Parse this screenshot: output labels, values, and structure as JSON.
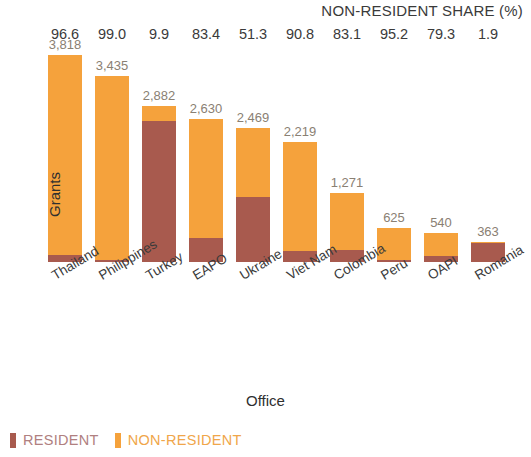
{
  "header": {
    "share_title": "NON-RESIDENT SHARE (%)"
  },
  "axes": {
    "y_title": "Grants",
    "x_title": "Office"
  },
  "legend": {
    "resident_label": "RESIDENT",
    "non_resident_label": "NON-RESIDENT",
    "resident_color": "#A85A4E",
    "non_resident_color": "#F5A23C"
  },
  "chart_data": {
    "type": "bar",
    "title": "",
    "subtitle": "",
    "xlabel": "Office",
    "ylabel": "Grants",
    "stacked": true,
    "grid": false,
    "legend_position": "bottom-left",
    "ylim": [
      0,
      4000
    ],
    "categories": [
      "Thailand",
      "Philippines",
      "Turkey",
      "EAPO",
      "Ukraine",
      "Viet Nam",
      "Colombia",
      "Peru",
      "OAPI",
      "Romania"
    ],
    "totals": [
      3818,
      3435,
      2882,
      2630,
      2469,
      2219,
      1271,
      625,
      540,
      363
    ],
    "total_labels": [
      "3,818",
      "3,435",
      "2,882",
      "2,630",
      "2,469",
      "2,219",
      "1,271",
      "625",
      "540",
      "363"
    ],
    "non_resident_share_pct": [
      96.6,
      99.0,
      9.9,
      83.4,
      51.3,
      90.8,
      83.1,
      95.2,
      79.3,
      1.9
    ],
    "non_resident_share_labels": [
      "96.6",
      "99.0",
      "9.9",
      "83.4",
      "51.3",
      "90.8",
      "83.1",
      "95.2",
      "79.3",
      "1.9"
    ],
    "series": [
      {
        "name": "RESIDENT",
        "color": "#A85A4E",
        "values": [
          130,
          34,
          2597,
          437,
          1202,
          204,
          215,
          30,
          112,
          356
        ]
      },
      {
        "name": "NON-RESIDENT",
        "color": "#F5A23C",
        "values": [
          3688,
          3401,
          285,
          2193,
          1267,
          2015,
          1056,
          595,
          428,
          7
        ]
      }
    ]
  }
}
